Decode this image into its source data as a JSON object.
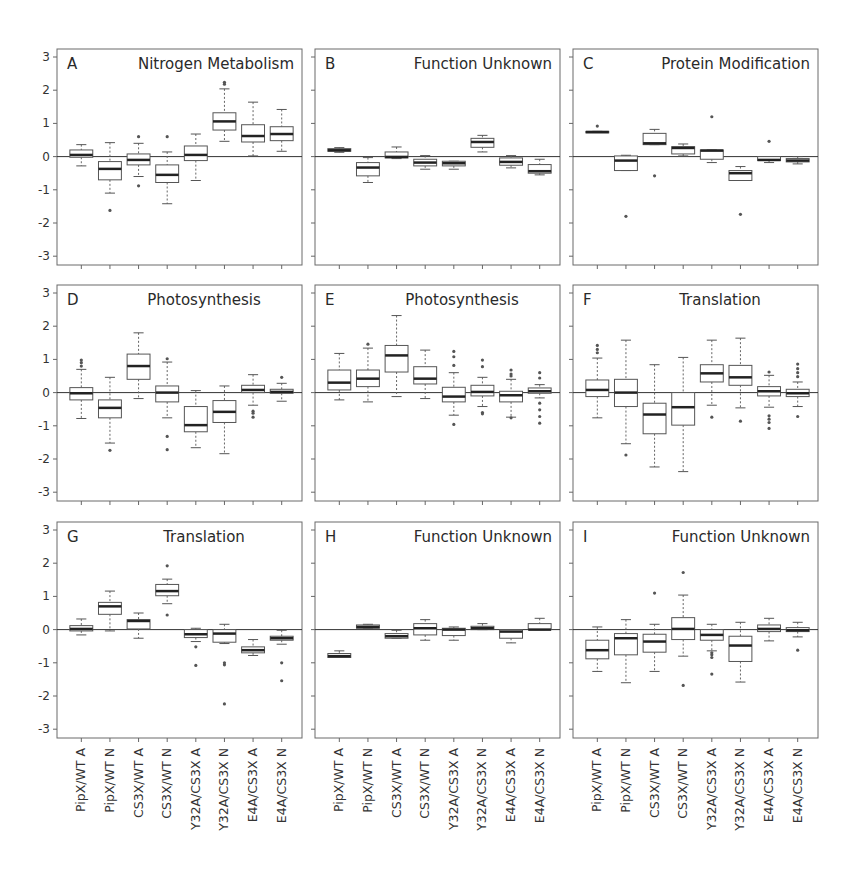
{
  "figure": {
    "ylim": [
      -3,
      3
    ],
    "yticks": [
      "3",
      "2",
      "1",
      "0",
      "-1",
      "-2",
      "-3"
    ],
    "categories": [
      "PipX/WT A",
      "PipX/WT N",
      "CS3X/WT A",
      "CS3X/WT N",
      "Y32A/CS3X A",
      "Y32A/CS3X N",
      "E4A/CS3X A",
      "E4A/CS3X N"
    ]
  },
  "chart_data": [
    {
      "type": "box",
      "panel": "A",
      "title": "Nitrogen Metabolism",
      "categories": [
        "PipX/WT A",
        "PipX/WT N",
        "CS3X/WT A",
        "CS3X/WT N",
        "Y32A/CS3X A",
        "Y32A/CS3X N",
        "E4A/CS3X A",
        "E4A/CS3X N"
      ],
      "ylim": [
        -3,
        3
      ],
      "boxes": [
        {
          "min": -0.28,
          "q1": -0.02,
          "median": 0.05,
          "q3": 0.2,
          "max": 0.36,
          "outliers": []
        },
        {
          "min": -1.1,
          "q1": -0.7,
          "median": -0.37,
          "q3": -0.15,
          "max": 0.42,
          "outliers": [
            -1.62
          ]
        },
        {
          "min": -0.6,
          "q1": -0.25,
          "median": -0.1,
          "q3": 0.08,
          "max": 0.4,
          "outliers": [
            0.6,
            -0.88
          ]
        },
        {
          "min": -1.42,
          "q1": -0.78,
          "median": -0.55,
          "q3": -0.25,
          "max": 0.14,
          "outliers": [
            0.6
          ]
        },
        {
          "min": -0.72,
          "q1": -0.12,
          "median": 0.05,
          "q3": 0.32,
          "max": 0.68,
          "outliers": []
        },
        {
          "min": 0.46,
          "q1": 0.8,
          "median": 1.06,
          "q3": 1.32,
          "max": 2.04,
          "outliers": [
            2.18,
            2.24
          ]
        },
        {
          "min": 0.02,
          "q1": 0.44,
          "median": 0.62,
          "q3": 0.96,
          "max": 1.64,
          "outliers": []
        },
        {
          "min": 0.16,
          "q1": 0.48,
          "median": 0.68,
          "q3": 0.9,
          "max": 1.42,
          "outliers": []
        }
      ]
    },
    {
      "type": "box",
      "panel": "B",
      "title": "Function Unknown",
      "categories": [
        "PipX/WT A",
        "PipX/WT N",
        "CS3X/WT A",
        "CS3X/WT N",
        "Y32A/CS3X A",
        "Y32A/CS3X N",
        "E4A/CS3X A",
        "E4A/CS3X N"
      ],
      "ylim": [
        -3,
        3
      ],
      "boxes": [
        {
          "min": 0.13,
          "q1": 0.16,
          "median": 0.19,
          "q3": 0.24,
          "max": 0.27,
          "outliers": []
        },
        {
          "min": -0.78,
          "q1": -0.58,
          "median": -0.33,
          "q3": -0.18,
          "max": -0.03,
          "outliers": []
        },
        {
          "min": -0.06,
          "q1": -0.04,
          "median": -0.01,
          "q3": 0.14,
          "max": 0.29,
          "outliers": []
        },
        {
          "min": -0.38,
          "q1": -0.28,
          "median": -0.18,
          "q3": -0.08,
          "max": 0.03,
          "outliers": []
        },
        {
          "min": -0.38,
          "q1": -0.28,
          "median": -0.2,
          "q3": -0.14,
          "max": -0.14,
          "outliers": []
        },
        {
          "min": 0.14,
          "q1": 0.28,
          "median": 0.44,
          "q3": 0.55,
          "max": 0.64,
          "outliers": []
        },
        {
          "min": -0.34,
          "q1": -0.26,
          "median": -0.16,
          "q3": -0.04,
          "max": 0.03,
          "outliers": []
        },
        {
          "min": -0.55,
          "q1": -0.5,
          "median": -0.44,
          "q3": -0.24,
          "max": -0.08,
          "outliers": []
        }
      ]
    },
    {
      "type": "box",
      "panel": "C",
      "title": "Protein Modification",
      "categories": [
        "PipX/WT A",
        "PipX/WT N",
        "CS3X/WT A",
        "CS3X/WT N",
        "Y32A/CS3X A",
        "Y32A/CS3X N",
        "E4A/CS3X A",
        "E4A/CS3X N"
      ],
      "ylim": [
        -3,
        3
      ],
      "boxes": [
        {
          "min": 0.74,
          "q1": 0.74,
          "median": 0.74,
          "q3": 0.76,
          "max": 0.76,
          "outliers": [
            0.92
          ]
        },
        {
          "min": -0.42,
          "q1": -0.42,
          "median": -0.12,
          "q3": 0.02,
          "max": 0.04,
          "outliers": [
            -1.8
          ]
        },
        {
          "min": 0.36,
          "q1": 0.36,
          "median": 0.4,
          "q3": 0.7,
          "max": 0.82,
          "outliers": [
            -0.58
          ]
        },
        {
          "min": 0.02,
          "q1": 0.08,
          "median": 0.26,
          "q3": 0.3,
          "max": 0.38,
          "outliers": []
        },
        {
          "min": -0.18,
          "q1": -0.08,
          "median": 0.18,
          "q3": 0.2,
          "max": 0.2,
          "outliers": [
            1.2
          ]
        },
        {
          "min": -0.72,
          "q1": -0.72,
          "median": -0.5,
          "q3": -0.42,
          "max": -0.3,
          "outliers": [
            -1.74
          ]
        },
        {
          "min": -0.18,
          "q1": -0.12,
          "median": -0.1,
          "q3": 0.0,
          "max": 0.0,
          "outliers": [
            0.46
          ]
        },
        {
          "min": -0.22,
          "q1": -0.16,
          "median": -0.12,
          "q3": -0.06,
          "max": 0.0,
          "outliers": []
        }
      ]
    },
    {
      "type": "box",
      "panel": "D",
      "title": "Photosynthesis",
      "categories": [
        "PipX/WT A",
        "PipX/WT N",
        "CS3X/WT A",
        "CS3X/WT N",
        "Y32A/CS3X A",
        "Y32A/CS3X N",
        "E4A/CS3X A",
        "E4A/CS3X N"
      ],
      "ylim": [
        -3,
        3
      ],
      "boxes": [
        {
          "min": -0.78,
          "q1": -0.22,
          "median": -0.02,
          "q3": 0.15,
          "max": 0.7,
          "outliers": [
            0.8,
            0.9,
            0.98
          ]
        },
        {
          "min": -1.52,
          "q1": -0.76,
          "median": -0.46,
          "q3": -0.22,
          "max": 0.46,
          "outliers": [
            -1.74
          ]
        },
        {
          "min": -0.18,
          "q1": 0.4,
          "median": 0.8,
          "q3": 1.16,
          "max": 1.8,
          "outliers": []
        },
        {
          "min": -0.76,
          "q1": -0.28,
          "median": 0.0,
          "q3": 0.2,
          "max": 0.92,
          "outliers": [
            1.02,
            -1.32,
            -1.72
          ]
        },
        {
          "min": -1.66,
          "q1": -1.18,
          "median": -0.98,
          "q3": -0.42,
          "max": 0.06,
          "outliers": []
        },
        {
          "min": -1.84,
          "q1": -0.9,
          "median": -0.58,
          "q3": -0.24,
          "max": 0.2,
          "outliers": []
        },
        {
          "min": -0.38,
          "q1": 0.0,
          "median": 0.08,
          "q3": 0.22,
          "max": 0.54,
          "outliers": [
            -0.56,
            -0.62,
            -0.74
          ]
        },
        {
          "min": -0.26,
          "q1": -0.02,
          "median": 0.02,
          "q3": 0.1,
          "max": 0.28,
          "outliers": [
            0.46
          ]
        }
      ]
    },
    {
      "type": "box",
      "panel": "E",
      "title": "Photosynthesis",
      "categories": [
        "PipX/WT A",
        "PipX/WT N",
        "CS3X/WT A",
        "CS3X/WT N",
        "Y32A/CS3X A",
        "Y32A/CS3X N",
        "E4A/CS3X A",
        "E4A/CS3X N"
      ],
      "ylim": [
        -3,
        3
      ],
      "boxes": [
        {
          "min": -0.22,
          "q1": 0.08,
          "median": 0.3,
          "q3": 0.68,
          "max": 1.18,
          "outliers": []
        },
        {
          "min": -0.28,
          "q1": 0.18,
          "median": 0.42,
          "q3": 0.68,
          "max": 1.34,
          "outliers": [
            1.46
          ]
        },
        {
          "min": -0.12,
          "q1": 0.62,
          "median": 1.12,
          "q3": 1.42,
          "max": 2.32,
          "outliers": []
        },
        {
          "min": -0.18,
          "q1": 0.26,
          "median": 0.42,
          "q3": 0.78,
          "max": 1.28,
          "outliers": []
        },
        {
          "min": -0.68,
          "q1": -0.28,
          "median": -0.12,
          "q3": 0.16,
          "max": 0.6,
          "outliers": [
            0.82,
            1.08,
            1.24,
            -0.96
          ]
        },
        {
          "min": -0.42,
          "q1": -0.1,
          "median": 0.02,
          "q3": 0.22,
          "max": 0.46,
          "outliers": [
            0.78,
            0.98,
            -0.6,
            -0.64
          ]
        },
        {
          "min": -0.74,
          "q1": -0.28,
          "median": -0.08,
          "q3": 0.04,
          "max": 0.4,
          "outliers": [
            0.5,
            0.56,
            0.68,
            -0.76
          ]
        },
        {
          "min": -0.16,
          "q1": -0.02,
          "median": 0.04,
          "q3": 0.14,
          "max": 0.24,
          "outliers": [
            0.44,
            0.6,
            -0.32,
            -0.52,
            -0.72,
            -0.92
          ]
        }
      ]
    },
    {
      "type": "box",
      "panel": "F",
      "title": "Translation",
      "categories": [
        "PipX/WT A",
        "PipX/WT N",
        "CS3X/WT A",
        "CS3X/WT N",
        "Y32A/CS3X A",
        "Y32A/CS3X N",
        "E4A/CS3X A",
        "E4A/CS3X N"
      ],
      "ylim": [
        -3,
        3
      ],
      "boxes": [
        {
          "min": -0.76,
          "q1": -0.12,
          "median": 0.08,
          "q3": 0.38,
          "max": 1.04,
          "outliers": [
            1.2,
            1.3,
            1.42
          ]
        },
        {
          "min": -1.54,
          "q1": -0.42,
          "median": 0.0,
          "q3": 0.4,
          "max": 1.58,
          "outliers": [
            -1.88
          ]
        },
        {
          "min": -2.24,
          "q1": -1.24,
          "median": -0.66,
          "q3": -0.32,
          "max": 0.84,
          "outliers": []
        },
        {
          "min": -2.38,
          "q1": -0.98,
          "median": -0.44,
          "q3": 0.0,
          "max": 1.06,
          "outliers": []
        },
        {
          "min": -0.38,
          "q1": 0.32,
          "median": 0.58,
          "q3": 0.84,
          "max": 1.58,
          "outliers": [
            -0.74
          ]
        },
        {
          "min": -0.46,
          "q1": 0.22,
          "median": 0.46,
          "q3": 0.82,
          "max": 1.64,
          "outliers": [
            -0.86
          ]
        },
        {
          "min": -0.44,
          "q1": -0.1,
          "median": 0.04,
          "q3": 0.18,
          "max": 0.52,
          "outliers": [
            0.62,
            -0.7,
            -0.8,
            -0.9,
            -1.08
          ]
        },
        {
          "min": -0.42,
          "q1": -0.12,
          "median": -0.02,
          "q3": 0.1,
          "max": 0.32,
          "outliers": [
            0.48,
            0.6,
            0.72,
            0.86,
            -0.72
          ]
        }
      ]
    },
    {
      "type": "box",
      "panel": "G",
      "title": "Translation",
      "categories": [
        "PipX/WT A",
        "PipX/WT N",
        "CS3X/WT A",
        "CS3X/WT N",
        "Y32A/CS3X A",
        "Y32A/CS3X N",
        "E4A/CS3X A",
        "E4A/CS3X N"
      ],
      "ylim": [
        -3,
        3
      ],
      "boxes": [
        {
          "min": -0.16,
          "q1": -0.04,
          "median": 0.02,
          "q3": 0.12,
          "max": 0.32,
          "outliers": []
        },
        {
          "min": -0.04,
          "q1": 0.46,
          "median": 0.7,
          "q3": 0.82,
          "max": 1.16,
          "outliers": []
        },
        {
          "min": -0.26,
          "q1": 0.02,
          "median": 0.26,
          "q3": 0.3,
          "max": 0.5,
          "outliers": []
        },
        {
          "min": 0.78,
          "q1": 1.02,
          "median": 1.16,
          "q3": 1.36,
          "max": 1.52,
          "outliers": [
            1.92,
            0.44
          ]
        },
        {
          "min": -0.36,
          "q1": -0.24,
          "median": -0.14,
          "q3": 0.0,
          "max": 0.04,
          "outliers": [
            -0.52,
            -1.08
          ]
        },
        {
          "min": -0.42,
          "q1": -0.38,
          "median": -0.12,
          "q3": 0.0,
          "max": 0.16,
          "outliers": [
            -1.0,
            -1.06,
            -2.24
          ]
        },
        {
          "min": -0.78,
          "q1": -0.7,
          "median": -0.62,
          "q3": -0.52,
          "max": -0.3,
          "outliers": []
        },
        {
          "min": -0.44,
          "q1": -0.32,
          "median": -0.26,
          "q3": -0.2,
          "max": -0.02,
          "outliers": [
            -1.0,
            -1.54
          ]
        }
      ]
    },
    {
      "type": "box",
      "panel": "H",
      "title": "Function Unknown",
      "categories": [
        "PipX/WT A",
        "PipX/WT N",
        "CS3X/WT A",
        "CS3X/WT N",
        "Y32A/CS3X A",
        "Y32A/CS3X N",
        "E4A/CS3X A",
        "E4A/CS3X N"
      ],
      "ylim": [
        -3,
        3
      ],
      "boxes": [
        {
          "min": -0.84,
          "q1": -0.84,
          "median": -0.8,
          "q3": -0.72,
          "max": -0.64,
          "outliers": []
        },
        {
          "min": 0.04,
          "q1": 0.04,
          "median": 0.08,
          "q3": 0.14,
          "max": 0.16,
          "outliers": []
        },
        {
          "min": -0.26,
          "q1": -0.26,
          "median": -0.2,
          "q3": -0.12,
          "max": -0.02,
          "outliers": []
        },
        {
          "min": -0.32,
          "q1": -0.16,
          "median": 0.04,
          "q3": 0.18,
          "max": 0.3,
          "outliers": []
        },
        {
          "min": -0.32,
          "q1": -0.18,
          "median": 0.0,
          "q3": 0.04,
          "max": 0.08,
          "outliers": []
        },
        {
          "min": 0.0,
          "q1": 0.0,
          "median": 0.04,
          "q3": 0.1,
          "max": 0.18,
          "outliers": []
        },
        {
          "min": -0.4,
          "q1": -0.26,
          "median": -0.06,
          "q3": 0.0,
          "max": 0.0,
          "outliers": []
        },
        {
          "min": 0.0,
          "q1": 0.0,
          "median": 0.0,
          "q3": 0.18,
          "max": 0.34,
          "outliers": []
        }
      ]
    },
    {
      "type": "box",
      "panel": "I",
      "title": "Function Unknown",
      "categories": [
        "PipX/WT A",
        "PipX/WT N",
        "CS3X/WT A",
        "CS3X/WT N",
        "Y32A/CS3X A",
        "Y32A/CS3X N",
        "E4A/CS3X A",
        "E4A/CS3X N"
      ],
      "ylim": [
        -3,
        3
      ],
      "boxes": [
        {
          "min": -1.26,
          "q1": -0.88,
          "median": -0.62,
          "q3": -0.32,
          "max": 0.08,
          "outliers": []
        },
        {
          "min": -1.6,
          "q1": -0.76,
          "median": -0.26,
          "q3": -0.12,
          "max": 0.3,
          "outliers": []
        },
        {
          "min": -1.26,
          "q1": -0.68,
          "median": -0.36,
          "q3": -0.14,
          "max": 0.16,
          "outliers": [
            1.1
          ]
        },
        {
          "min": -0.8,
          "q1": -0.3,
          "median": 0.02,
          "q3": 0.36,
          "max": 1.04,
          "outliers": [
            1.72,
            -1.68
          ]
        },
        {
          "min": -0.64,
          "q1": -0.32,
          "median": -0.16,
          "q3": 0.0,
          "max": 0.16,
          "outliers": [
            -0.7,
            -0.76,
            -0.84,
            -1.34
          ]
        },
        {
          "min": -1.58,
          "q1": -0.96,
          "median": -0.48,
          "q3": -0.2,
          "max": 0.22,
          "outliers": []
        },
        {
          "min": -0.34,
          "q1": -0.06,
          "median": 0.02,
          "q3": 0.14,
          "max": 0.34,
          "outliers": []
        },
        {
          "min": -0.22,
          "q1": -0.06,
          "median": -0.02,
          "q3": 0.06,
          "max": 0.22,
          "outliers": [
            -0.62
          ]
        }
      ]
    }
  ]
}
